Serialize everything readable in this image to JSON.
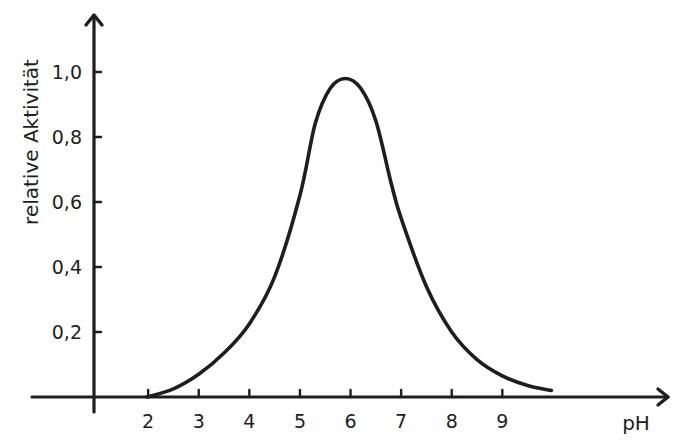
{
  "chart_data": {
    "type": "line",
    "title": "",
    "xlabel": "pH",
    "ylabel": "relative Aktivität",
    "x_ticks": [
      2,
      3,
      4,
      5,
      6,
      7,
      8,
      9
    ],
    "x_tick_labels": [
      "2",
      "3",
      "4",
      "5",
      "6",
      "7",
      "8",
      "9"
    ],
    "y_ticks": [
      0.2,
      0.4,
      0.6,
      0.8,
      1.0
    ],
    "y_tick_labels": [
      "0,2",
      "0,4",
      "0,6",
      "0,8",
      "1,0"
    ],
    "xlim": [
      0.93,
      12.3
    ],
    "ylim": [
      0,
      1.2
    ],
    "grid": false,
    "legend": "none",
    "series": [
      {
        "name": "relative Aktivität",
        "x": [
          1.98,
          2.5,
          3.0,
          3.5,
          4.0,
          4.5,
          5.0,
          5.3,
          5.6,
          5.9,
          6.2,
          6.5,
          6.8,
          7.0,
          7.5,
          8.0,
          8.5,
          9.0,
          9.5,
          9.97
        ],
        "y": [
          0.0,
          0.025,
          0.07,
          0.135,
          0.225,
          0.37,
          0.62,
          0.84,
          0.95,
          0.98,
          0.95,
          0.85,
          0.66,
          0.55,
          0.34,
          0.2,
          0.115,
          0.065,
          0.035,
          0.02
        ]
      }
    ]
  }
}
